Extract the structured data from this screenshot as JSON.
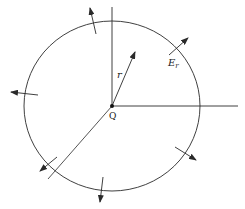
{
  "diagram": {
    "type": "gauss-sphere-point-charge",
    "labels": {
      "charge": "Q",
      "radius": "r",
      "field": "E",
      "field_subscript": "r"
    },
    "center": {
      "x": 112,
      "y": 106
    },
    "circle": {
      "rx": 88,
      "ry": 85
    },
    "stroke_color": "#2a2a2a",
    "field_arrows": [
      {
        "name": "top",
        "angle_deg": 103
      },
      {
        "name": "upper-right",
        "angle_deg": 40
      },
      {
        "name": "left",
        "angle_deg": 175
      },
      {
        "name": "lower-left",
        "angle_deg": 220
      },
      {
        "name": "bottom",
        "angle_deg": 262
      },
      {
        "name": "lower-right",
        "angle_deg": 323
      }
    ]
  }
}
